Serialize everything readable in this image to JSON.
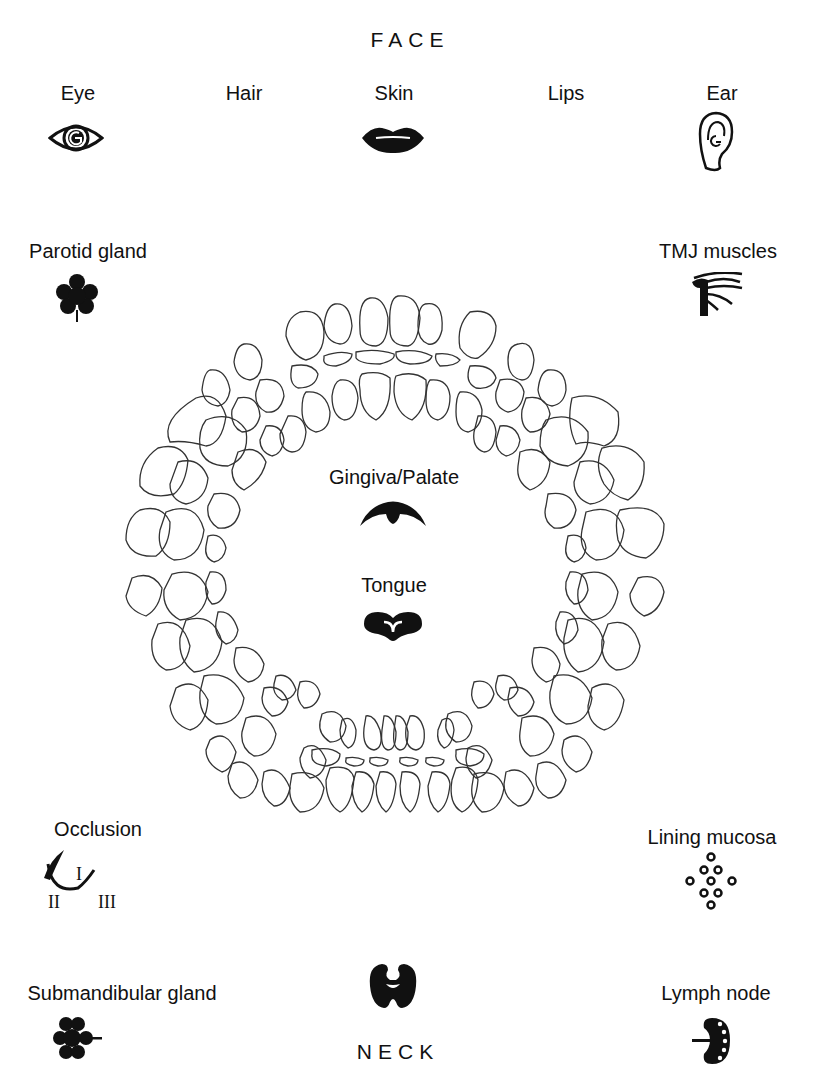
{
  "face": {
    "title": "FACE"
  },
  "neck": {
    "title": "NECK"
  },
  "labels": {
    "eye": "Eye",
    "hair": "Hair",
    "skin": "Skin",
    "lips": "Lips",
    "ear": "Ear",
    "parotid": "Parotid gland",
    "tmj": "TMJ muscles",
    "gingiva": "Gingiva/Palate",
    "tongue": "Tongue",
    "occlusion": "Occlusion",
    "lining": "Lining mucosa",
    "submandibular": "Submandibular gland",
    "lymph": "Lymph node"
  },
  "occlusion_classes": {
    "c1": "I",
    "c2": "II",
    "c3": "III"
  },
  "icons": [
    "eye-icon",
    "lips-icon",
    "ear-icon",
    "parotid-gland-icon",
    "tmj-muscles-icon",
    "palate-icon",
    "tongue-icon",
    "occlusion-icon",
    "lining-mucosa-icon",
    "thyroid-icon",
    "submandibular-gland-icon",
    "lymph-node-icon"
  ]
}
